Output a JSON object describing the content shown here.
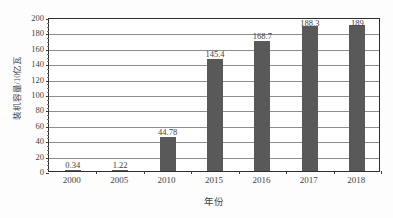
{
  "chart_data": {
    "type": "bar",
    "title": "",
    "subtitle": "",
    "categories": [
      "2000",
      "2005",
      "2010",
      "2015",
      "2016",
      "2017",
      "2018"
    ],
    "values": [
      0.34,
      1.22,
      44.78,
      145.4,
      168.7,
      188.3,
      189
    ],
    "value_labels": [
      "0.34",
      "1.22",
      "44.78",
      "145.4",
      "168.7",
      "188.3",
      "189"
    ],
    "xlabel": "年份",
    "ylabel": "装机容量/10亿瓦",
    "ylim": [
      0,
      200
    ],
    "ytick_labels": [
      "0",
      "20",
      "40",
      "60",
      "80",
      "100",
      "120",
      "140",
      "160",
      "180",
      "200"
    ],
    "ytick_values": [
      0,
      20,
      40,
      60,
      80,
      100,
      120,
      140,
      160,
      180,
      200
    ],
    "grid": true,
    "legend": false,
    "legend_position": "none",
    "series": [
      {
        "name": "装机容量",
        "values": [
          0.34,
          1.22,
          44.78,
          145.4,
          168.7,
          188.3,
          189
        ]
      }
    ]
  },
  "style": {
    "bar_color": "#595959",
    "gridline_color": "#8d8d8d",
    "frame_color": "#2e2e2e",
    "text_color": "#3d3d3d",
    "background": "#ffffff"
  }
}
